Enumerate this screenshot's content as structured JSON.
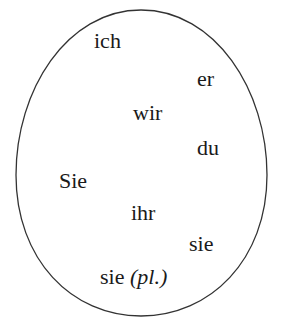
{
  "diagram": {
    "shape": "ellipse",
    "stroke_color": "#333333",
    "pronouns": [
      {
        "text": "ich",
        "x": 94,
        "y": 30
      },
      {
        "text": "er",
        "x": 197,
        "y": 68
      },
      {
        "text": "wir",
        "x": 133,
        "y": 102
      },
      {
        "text": "du",
        "x": 197,
        "y": 137
      },
      {
        "text": "Sie",
        "x": 59,
        "y": 170
      },
      {
        "text": "ihr",
        "x": 131,
        "y": 202
      },
      {
        "text": "sie",
        "x": 189,
        "y": 233
      },
      {
        "text": "sie",
        "x": 100,
        "y": 266,
        "annotation": "(pl.)"
      }
    ]
  }
}
